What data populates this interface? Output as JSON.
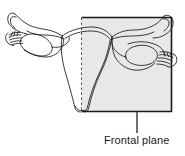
{
  "figure": {
    "labels": {
      "frontal_plane": "Frontal plane"
    },
    "colors": {
      "outline": "#1a1a1a",
      "plane_fill": "#e8e8e6",
      "plane_border": "#1a1a1a",
      "leader_line": "#4d4d4d",
      "dashed_edge": "#555555",
      "text": "#1a1a1a",
      "background": "#ffffff"
    },
    "plane_box": {
      "x": 81,
      "y": 17,
      "width": 91,
      "height": 95,
      "left_edge_style": "dashed",
      "other_edges_style": "solid"
    },
    "leader_line": {
      "x": 137,
      "y_top": 112,
      "y_bottom": 133
    },
    "structures": [
      {
        "name": "left-ovary",
        "side": "left"
      },
      {
        "name": "left-uterine-tube",
        "side": "left"
      },
      {
        "name": "left-fimbriae",
        "side": "left"
      },
      {
        "name": "right-ovary",
        "side": "right"
      },
      {
        "name": "right-uterine-tube",
        "side": "right"
      },
      {
        "name": "right-fimbriae",
        "side": "right"
      },
      {
        "name": "uterus-body",
        "side": "center"
      },
      {
        "name": "cervix-vagina",
        "side": "center"
      }
    ]
  }
}
